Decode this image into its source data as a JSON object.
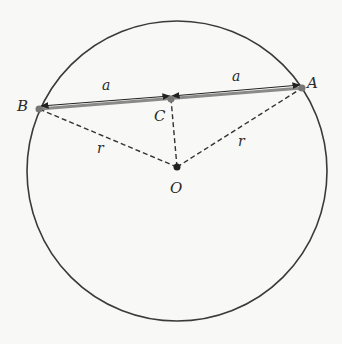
{
  "diagram": {
    "type": "circle-chord-geometry",
    "circle": {
      "cx": 177,
      "cy": 171,
      "r": 150,
      "stroke": "#3a3a3a"
    },
    "points": {
      "A": {
        "x": 302,
        "y": 88,
        "label": "A",
        "label_x": 307,
        "label_y": 88
      },
      "B": {
        "x": 39,
        "y": 109,
        "label": "B",
        "label_x": 17,
        "label_y": 111
      },
      "C": {
        "x": 171,
        "y": 99,
        "label": "C",
        "label_x": 154,
        "label_y": 121
      },
      "O": {
        "x": 177,
        "y": 167,
        "label": "O",
        "label_x": 170,
        "label_y": 193
      }
    },
    "segment_labels": {
      "left_half": {
        "text": "a",
        "x": 102,
        "y": 90
      },
      "right_half": {
        "text": "a",
        "x": 232,
        "y": 81
      },
      "left_radius": {
        "text": "r",
        "x": 97,
        "y": 153
      },
      "right_radius": {
        "text": "r",
        "x": 238,
        "y": 146
      }
    },
    "colors": {
      "chord": "#8a8a8a",
      "arrow": "#222222",
      "dashed": "#333333",
      "point": "#777777",
      "center_point": "#222222"
    }
  }
}
